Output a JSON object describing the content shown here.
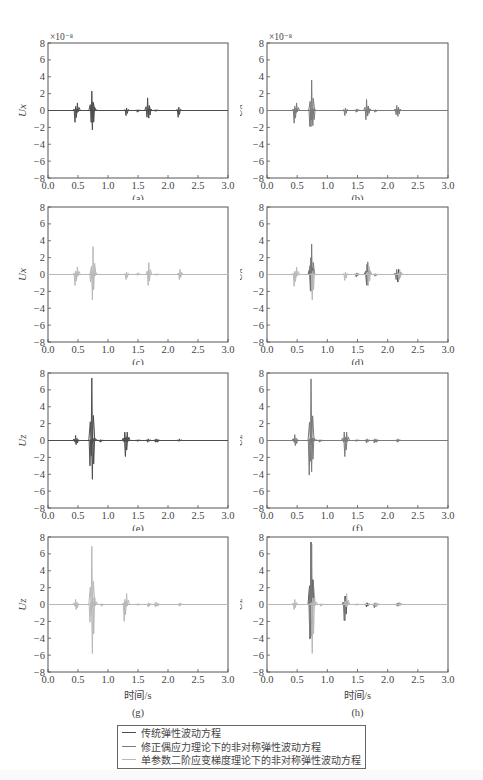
{
  "figure": {
    "exponent_label": "×10⁻⁸",
    "x_ticks": [
      "0.0",
      "0.5",
      "1.0",
      "1.5",
      "2.0",
      "2.5",
      "3.0"
    ],
    "y_ticks": [
      "8",
      "6",
      "4",
      "2",
      "0",
      "−2",
      "−4",
      "−6",
      "−8"
    ],
    "xlabel_bottom": "时间/s",
    "colors": {
      "traditional": "#4d4d4d",
      "couple_stress": "#7a7a7a",
      "strain_gradient": "#b8b8b8",
      "axis": "#555555"
    }
  },
  "legend": {
    "items": [
      {
        "label": "传统弹性波动方程",
        "color": "#4d4d4d"
      },
      {
        "label": "修正偶应力理论下的非对称弹性波动方程",
        "color": "#7a7a7a"
      },
      {
        "label": "单参数二阶应变梯度理论下的非对称弹性波动方程",
        "color": "#b8b8b8"
      }
    ]
  },
  "chart_data": [
    {
      "id": "a",
      "type": "line",
      "caption": "(a)",
      "ylabel": "Ux",
      "exponent": "×10⁻⁸",
      "xlabel": "",
      "xlim": [
        0,
        3
      ],
      "ylim": [
        -8,
        8
      ],
      "series": [
        {
          "name": "传统弹性波动方程",
          "color": "#4d4d4d",
          "events": [
            [
              0.46,
              0.5,
              -1.4
            ],
            [
              0.49,
              0.9,
              -0.3
            ],
            [
              0.73,
              2.3,
              -1.4
            ],
            [
              0.75,
              1.0,
              -2.3
            ],
            [
              0.78,
              0.2,
              -0.1
            ],
            [
              1.31,
              0.3,
              -0.6
            ],
            [
              1.5,
              0.1,
              -0.2
            ],
            [
              1.66,
              1.5,
              -0.8
            ],
            [
              1.69,
              0.4,
              -0.9
            ],
            [
              1.8,
              0.1,
              -0.1
            ],
            [
              2.18,
              0.4,
              -0.8
            ]
          ]
        }
      ]
    },
    {
      "id": "b",
      "type": "line",
      "caption": "(b)",
      "ylabel": "Ux",
      "exponent": "×10⁻⁸",
      "xlabel": "",
      "xlim": [
        0,
        3
      ],
      "ylim": [
        -8,
        8
      ],
      "series": [
        {
          "name": "修正偶应力理论下的非对称弹性波动方程",
          "color": "#7a7a7a",
          "events": [
            [
              0.46,
              0.5,
              -1.5
            ],
            [
              0.49,
              0.9,
              -0.3
            ],
            [
              0.72,
              0.3,
              -1.9
            ],
            [
              0.74,
              3.6,
              -1.9
            ],
            [
              0.77,
              0.2,
              -1.8
            ],
            [
              1.3,
              0.3,
              -0.6
            ],
            [
              1.49,
              0.2,
              -0.2
            ],
            [
              1.65,
              1.3,
              -1.1
            ],
            [
              1.68,
              0.5,
              -0.6
            ],
            [
              1.8,
              0.1,
              -0.2
            ],
            [
              2.15,
              0.6,
              -0.5
            ],
            [
              2.18,
              0.4,
              -0.7
            ]
          ]
        }
      ]
    },
    {
      "id": "c",
      "type": "line",
      "caption": "(c)",
      "ylabel": "Ux",
      "exponent": "",
      "xlabel": "",
      "xlim": [
        0,
        3
      ],
      "ylim": [
        -8,
        8
      ],
      "series": [
        {
          "name": "单参数二阶应变梯度理论下的非对称弹性波动方程",
          "color": "#b8b8b8",
          "events": [
            [
              0.46,
              0.4,
              -1.3
            ],
            [
              0.49,
              0.9,
              -0.3
            ],
            [
              0.72,
              0.2,
              -0.9
            ],
            [
              0.75,
              3.3,
              -3.0
            ],
            [
              0.78,
              0.4,
              -0.2
            ],
            [
              1.31,
              0.3,
              -0.6
            ],
            [
              1.5,
              0.2,
              -0.1
            ],
            [
              1.68,
              1.4,
              -1.3
            ],
            [
              1.81,
              0.1,
              -0.1
            ],
            [
              2.2,
              0.6,
              -0.6
            ]
          ]
        }
      ]
    },
    {
      "id": "d",
      "type": "line",
      "caption": "(d)",
      "ylabel": "Ux",
      "exponent": "",
      "xlabel": "",
      "xlim": [
        0,
        3
      ],
      "ylim": [
        -8,
        8
      ],
      "series": [
        {
          "name": "传统弹性波动方程",
          "color": "#4d4d4d",
          "events": [
            [
              0.73,
              2.0,
              -1.9
            ],
            [
              1.66,
              1.2,
              -1.2
            ],
            [
              2.18,
              0.6,
              -0.9
            ]
          ]
        },
        {
          "name": "修正偶应力理论下的非对称弹性波动方程",
          "color": "#7a7a7a",
          "events": [
            [
              0.74,
              3.6,
              -2.0
            ],
            [
              1.67,
              1.5,
              -1.3
            ],
            [
              2.15,
              0.6,
              -0.6
            ],
            [
              1.49,
              0.2,
              -0.3
            ],
            [
              1.8,
              0.1,
              -0.2
            ]
          ]
        },
        {
          "name": "单参数二阶应变梯度理论下的非对称弹性波动方程",
          "color": "#b8b8b8",
          "events": [
            [
              0.46,
              0.4,
              -1.4
            ],
            [
              0.49,
              0.9,
              -0.3
            ],
            [
              0.76,
              0.4,
              -3.0
            ],
            [
              1.3,
              0.3,
              -0.7
            ],
            [
              1.69,
              1.0,
              -1.3
            ],
            [
              2.2,
              0.6,
              -0.6
            ]
          ]
        }
      ]
    },
    {
      "id": "e",
      "type": "line",
      "caption": "(e)",
      "ylabel": "Uz",
      "exponent": "",
      "xlabel": "",
      "xlim": [
        0,
        3
      ],
      "ylim": [
        -8,
        8
      ],
      "series": [
        {
          "name": "传统弹性波动方程",
          "color": "#4d4d4d",
          "events": [
            [
              0.46,
              0.6,
              -0.2
            ],
            [
              0.48,
              0.1,
              -0.5
            ],
            [
              0.71,
              0.1,
              -3.0
            ],
            [
              0.73,
              7.4,
              -0.5
            ],
            [
              0.75,
              0.3,
              -4.6
            ],
            [
              0.78,
              0.3,
              -0.1
            ],
            [
              0.88,
              0.1,
              -0.2
            ],
            [
              1.28,
              1.0,
              -0.2
            ],
            [
              1.3,
              0.2,
              -1.9
            ],
            [
              1.32,
              1.0,
              -0.2
            ],
            [
              1.5,
              0.1,
              -0.1
            ],
            [
              1.67,
              0.2,
              -0.2
            ],
            [
              1.8,
              0.2,
              -0.2
            ],
            [
              1.83,
              0.1,
              -0.2
            ],
            [
              2.19,
              0.2,
              -0.1
            ]
          ]
        }
      ]
    },
    {
      "id": "f",
      "type": "line",
      "caption": "(f)",
      "ylabel": "Uz",
      "exponent": "",
      "xlabel": "",
      "xlim": [
        0,
        3
      ],
      "ylim": [
        -8,
        8
      ],
      "series": [
        {
          "name": "修正偶应力理论下的非对称弹性波动方程",
          "color": "#7a7a7a",
          "events": [
            [
              0.46,
              0.7,
              -0.2
            ],
            [
              0.48,
              0.1,
              -0.6
            ],
            [
              0.71,
              0.2,
              -4.1
            ],
            [
              0.73,
              7.3,
              -0.5
            ],
            [
              0.75,
              0.3,
              -3.7
            ],
            [
              0.78,
              0.3,
              -0.1
            ],
            [
              0.88,
              0.1,
              -0.2
            ],
            [
              1.28,
              1.0,
              -0.2
            ],
            [
              1.3,
              0.2,
              -1.9
            ],
            [
              1.32,
              1.0,
              -0.2
            ],
            [
              1.49,
              0.1,
              -0.1
            ],
            [
              1.66,
              0.2,
              -0.3
            ],
            [
              1.79,
              0.2,
              -0.3
            ],
            [
              1.82,
              0.1,
              -0.2
            ],
            [
              2.17,
              0.2,
              -0.2
            ]
          ]
        }
      ]
    },
    {
      "id": "g",
      "type": "line",
      "caption": "(g)",
      "ylabel": "Uz",
      "exponent": "",
      "xlabel": "时间/s",
      "xlim": [
        0,
        3
      ],
      "ylim": [
        -8,
        8
      ],
      "series": [
        {
          "name": "单参数二阶应变梯度理论下的非对称弹性波动方程",
          "color": "#b8b8b8",
          "events": [
            [
              0.46,
              0.6,
              -0.2
            ],
            [
              0.48,
              0.1,
              -0.6
            ],
            [
              0.71,
              0.2,
              -2.1
            ],
            [
              0.73,
              6.9,
              -0.5
            ],
            [
              0.75,
              0.8,
              -5.8
            ],
            [
              0.78,
              0.8,
              -0.2
            ],
            [
              0.9,
              0.1,
              -0.2
            ],
            [
              1.28,
              0.6,
              -2.0
            ],
            [
              1.31,
              1.3,
              -0.3
            ],
            [
              1.5,
              0.1,
              -0.1
            ],
            [
              1.68,
              0.2,
              -0.3
            ],
            [
              1.8,
              0.3,
              -0.3
            ],
            [
              1.83,
              0.1,
              -0.2
            ],
            [
              2.2,
              0.2,
              -0.2
            ]
          ]
        }
      ]
    },
    {
      "id": "h",
      "type": "line",
      "caption": "(h)",
      "ylabel": "Uz",
      "exponent": "",
      "xlabel": "时间/s",
      "xlim": [
        0,
        3
      ],
      "ylim": [
        -8,
        8
      ],
      "series": [
        {
          "name": "传统弹性波动方程",
          "color": "#4d4d4d",
          "events": [
            [
              0.73,
              7.4,
              -4.0
            ],
            [
              1.3,
              1.0,
              -1.9
            ],
            [
              1.66,
              0.2,
              -0.3
            ],
            [
              2.19,
              0.2,
              -0.1
            ]
          ]
        },
        {
          "name": "修正偶应力理论下的非对称弹性波动方程",
          "color": "#7a7a7a",
          "events": [
            [
              0.72,
              0.2,
              -4.1
            ],
            [
              0.74,
              7.2,
              -3.8
            ],
            [
              1.29,
              1.0,
              -1.9
            ],
            [
              1.79,
              0.2,
              -0.4
            ],
            [
              2.17,
              0.2,
              -0.2
            ]
          ]
        },
        {
          "name": "单参数二阶应变梯度理论下的非对称弹性波动方程",
          "color": "#b8b8b8",
          "events": [
            [
              0.46,
              0.6,
              -0.6
            ],
            [
              0.76,
              0.8,
              -5.8
            ],
            [
              0.79,
              0.8,
              -0.2
            ],
            [
              0.9,
              0.1,
              -0.2
            ],
            [
              1.32,
              1.3,
              -0.3
            ],
            [
              1.49,
              0.1,
              -0.1
            ],
            [
              1.82,
              0.2,
              -0.3
            ],
            [
              2.2,
              0.2,
              -0.2
            ]
          ]
        }
      ]
    }
  ]
}
